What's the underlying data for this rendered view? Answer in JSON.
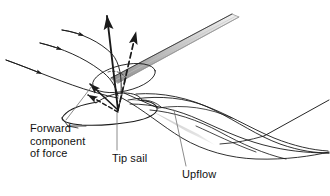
{
  "figure": {
    "kind": "aerodynamics-diagram",
    "background_color": "#ffffff",
    "ink_color": "#1a1a1a",
    "shade_color": "#b9b9b9"
  },
  "labels": {
    "forward_component": "Forward\ncomponent\nof force",
    "forward_component_lines": [
      "Forward",
      "component",
      "of force"
    ],
    "tip_sail": "Tip sail",
    "upflow": "Upflow"
  },
  "annotations": {
    "leader_forward": "leader-line-forward-component",
    "leader_tipsail": "leader-line-tip-sail",
    "leader_upflow": "leader-line-upflow"
  },
  "vectors": {
    "resultant_force": {
      "style": "solid",
      "direction": "up-left",
      "label": "resultant force vector"
    },
    "secondary_force": {
      "style": "dashed",
      "direction": "up-right",
      "label": "dashed force vector"
    },
    "forward_component_arrow": {
      "style": "solid",
      "direction": "up-left",
      "label": "forward component of force"
    },
    "forward_component_arrow_dashed": {
      "style": "dashed",
      "direction": "up-left",
      "label": "forward component dashed"
    }
  },
  "flow": {
    "streamline_count": 3,
    "vortex_helix_count": 2,
    "description": "oncoming streamlines curving up over the tip, trailing helical vortex downstream"
  }
}
